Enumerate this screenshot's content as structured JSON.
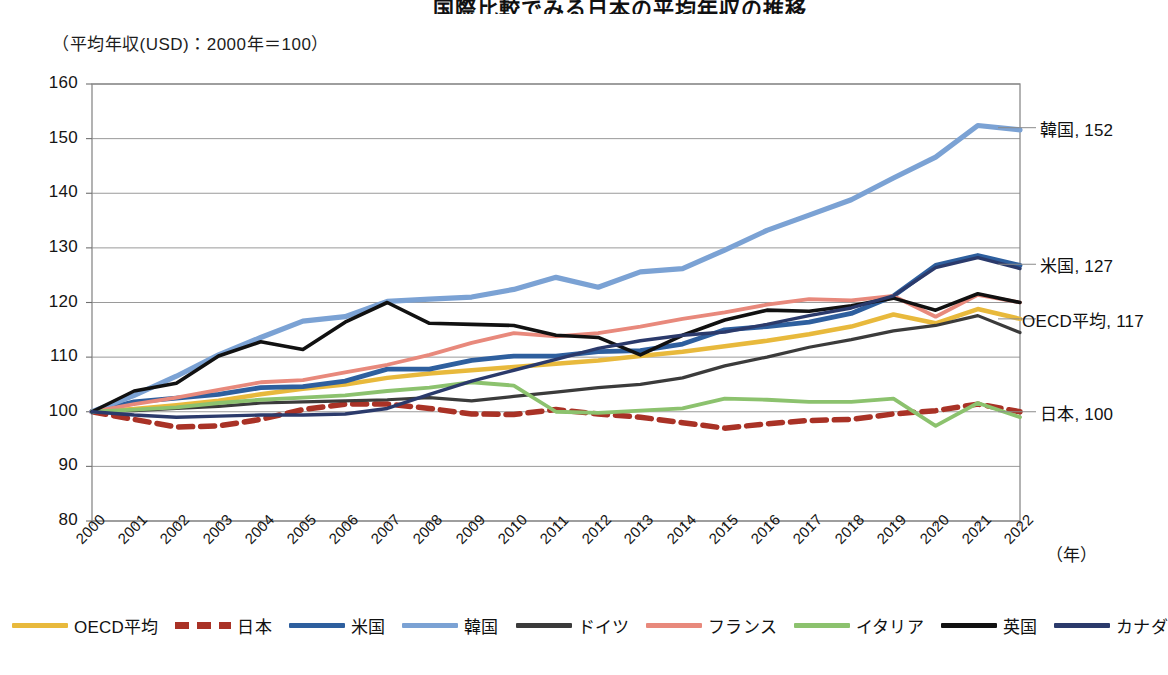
{
  "header": {
    "title": "国際比較でみる日本の平均年収の推移",
    "subtitle": "（平均年収(USD)：2000年＝100）",
    "axis_unit": "（年）"
  },
  "chart_data": {
    "type": "line",
    "title": "国際比較でみる日本の平均年収の推移",
    "subtitle": "（平均年収(USD)：2000年＝100）",
    "xlabel": "（年）",
    "ylabel": "",
    "ylim": [
      80,
      160
    ],
    "ytick_step": 10,
    "yticks": [
      80,
      90,
      100,
      110,
      120,
      130,
      140,
      150,
      160
    ],
    "grid": true,
    "legend_position": "bottom",
    "x": [
      2000,
      2001,
      2002,
      2003,
      2004,
      2005,
      2006,
      2007,
      2008,
      2009,
      2010,
      2011,
      2012,
      2013,
      2014,
      2015,
      2016,
      2017,
      2018,
      2019,
      2020,
      2021,
      2022
    ],
    "categories": [
      "2000",
      "2001",
      "2002",
      "2003",
      "2004",
      "2005",
      "2006",
      "2007",
      "2008",
      "2009",
      "2010",
      "2011",
      "2012",
      "2013",
      "2014",
      "2015",
      "2016",
      "2017",
      "2018",
      "2019",
      "2020",
      "2021",
      "2022"
    ],
    "series": [
      {
        "name": "OECD平均",
        "color": "#E8B93C",
        "style": "solid",
        "width": 4.5,
        "end_label": "OECD平均, 117",
        "end_value": 117,
        "values": [
          100,
          100.5,
          101.2,
          102.0,
          103.2,
          104.2,
          105.0,
          106.2,
          107.0,
          107.6,
          108.2,
          108.8,
          109.4,
          110.2,
          111.0,
          112.0,
          113.0,
          114.2,
          115.6,
          117.8,
          116.2,
          118.8,
          117.0
        ]
      },
      {
        "name": "日本",
        "color": "#A93226",
        "style": "dashed",
        "width": 5.5,
        "end_label": "日本, 100",
        "end_value": 100,
        "values": [
          100,
          98.6,
          97.2,
          97.4,
          98.6,
          100.4,
          101.4,
          101.4,
          100.6,
          99.6,
          99.5,
          100.4,
          99.6,
          99.0,
          98.0,
          97.0,
          97.8,
          98.4,
          98.6,
          99.6,
          100.2,
          101.4,
          100.0
        ]
      },
      {
        "name": "米国",
        "color": "#2E5F9E",
        "style": "solid",
        "width": 4.8,
        "end_label": "米国, 127",
        "end_value": 127,
        "values": [
          100,
          101.8,
          102.5,
          103.2,
          104.4,
          104.6,
          105.6,
          107.8,
          107.8,
          109.4,
          110.2,
          110.2,
          111.0,
          111.2,
          112.4,
          115.0,
          115.6,
          116.4,
          118.0,
          121.2,
          126.8,
          128.6,
          126.8
        ]
      },
      {
        "name": "韓国",
        "color": "#7BA2D4",
        "style": "solid",
        "width": 5.2,
        "end_label": "韓国, 152",
        "end_value": 152,
        "values": [
          100,
          103.0,
          106.5,
          110.4,
          113.6,
          116.6,
          117.4,
          120.2,
          120.6,
          121.0,
          122.4,
          124.6,
          122.8,
          125.6,
          126.2,
          129.6,
          133.2,
          136.0,
          138.8,
          142.8,
          146.6,
          152.4,
          151.6
        ]
      },
      {
        "name": "ドイツ",
        "color": "#3B3B3B",
        "style": "solid",
        "width": 3.2,
        "end_label": "",
        "end_value": 114.5,
        "values": [
          100,
          100.2,
          100.6,
          101.0,
          101.6,
          101.8,
          102.0,
          102.2,
          102.6,
          102.0,
          102.8,
          103.6,
          104.4,
          105.0,
          106.2,
          108.4,
          110.0,
          111.8,
          113.2,
          114.8,
          115.8,
          117.6,
          114.5
        ]
      },
      {
        "name": "フランス",
        "color": "#E8897C",
        "style": "solid",
        "width": 3.8,
        "end_label": "",
        "end_value": 120,
        "values": [
          100,
          101.4,
          102.6,
          104.0,
          105.4,
          105.8,
          107.2,
          108.6,
          110.4,
          112.6,
          114.4,
          113.8,
          114.4,
          115.6,
          117.0,
          118.2,
          119.6,
          120.6,
          120.4,
          121.2,
          117.4,
          121.4,
          120.0
        ]
      },
      {
        "name": "イタリア",
        "color": "#8CC26E",
        "style": "solid",
        "width": 3.8,
        "end_label": "",
        "end_value": 99,
        "values": [
          100,
          100.4,
          100.8,
          101.6,
          102.2,
          102.6,
          103.0,
          103.8,
          104.4,
          105.4,
          104.8,
          100.0,
          99.8,
          100.2,
          100.6,
          102.4,
          102.2,
          101.8,
          101.8,
          102.4,
          97.4,
          101.6,
          99.0
        ]
      },
      {
        "name": "英国",
        "color": "#111111",
        "style": "solid",
        "width": 3.6,
        "end_label": "",
        "end_value": 120,
        "values": [
          100,
          103.8,
          105.2,
          110.2,
          112.8,
          111.4,
          116.4,
          120.0,
          116.2,
          116.0,
          115.8,
          114.0,
          113.6,
          110.4,
          114.0,
          116.8,
          118.6,
          118.4,
          119.4,
          120.8,
          118.6,
          121.6,
          120.0
        ]
      },
      {
        "name": "カナダ",
        "color": "#2B3A6B",
        "style": "solid",
        "width": 3.4,
        "end_label": "",
        "end_value": 126,
        "values": [
          100,
          99.4,
          99.0,
          99.2,
          99.4,
          99.4,
          99.6,
          100.6,
          103.2,
          105.6,
          107.6,
          109.6,
          111.6,
          113.0,
          114.0,
          114.6,
          116.0,
          117.6,
          119.0,
          121.2,
          126.4,
          128.2,
          126.2
        ]
      }
    ]
  },
  "plot_geometry": {
    "left": 92,
    "top": 84,
    "right": 1020,
    "bottom": 521
  },
  "end_labels": [
    {
      "text": "韓国, 152",
      "value": 152
    },
    {
      "text": "米国, 127",
      "value": 127
    },
    {
      "text": "OECD平均, 117",
      "value": 117
    },
    {
      "text": "日本, 100",
      "value": 100
    }
  ],
  "legend": {
    "items": [
      {
        "label": "OECD平均",
        "color": "#E8B93C",
        "style": "solid"
      },
      {
        "label": "日本",
        "color": "#A93226",
        "style": "dashed"
      },
      {
        "label": "米国",
        "color": "#2E5F9E",
        "style": "solid"
      },
      {
        "label": "韓国",
        "color": "#7BA2D4",
        "style": "solid"
      },
      {
        "label": "ドイツ",
        "color": "#3B3B3B",
        "style": "solid"
      },
      {
        "label": "フランス",
        "color": "#E8897C",
        "style": "solid"
      },
      {
        "label": "イタリア",
        "color": "#8CC26E",
        "style": "solid"
      },
      {
        "label": "英国",
        "color": "#111111",
        "style": "solid"
      },
      {
        "label": "カナダ",
        "color": "#2B3A6B",
        "style": "solid"
      }
    ]
  }
}
